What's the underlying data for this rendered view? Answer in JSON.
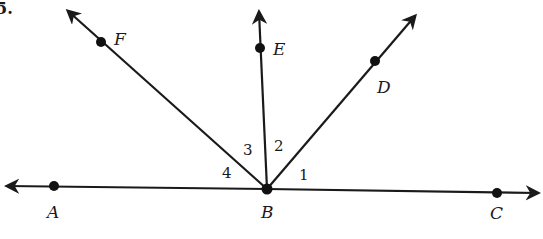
{
  "diagram": {
    "type": "angles-at-a-point",
    "corner_mark": "5.",
    "vertex": {
      "label": "B",
      "x": 267,
      "y": 189
    },
    "line": {
      "name": "line AC",
      "points": [
        {
          "label": "A",
          "x": 54,
          "y": 186
        },
        {
          "label": "C",
          "x": 497,
          "y": 193
        }
      ],
      "arrow_left": {
        "x": 7,
        "y": 186
      },
      "arrow_right": {
        "x": 538,
        "y": 193
      }
    },
    "rays": [
      {
        "name": "ray BF",
        "point": {
          "label": "F",
          "x": 101,
          "y": 42
        },
        "arrow": {
          "x": 68,
          "y": 11
        }
      },
      {
        "name": "ray BE",
        "point": {
          "label": "E",
          "x": 260,
          "y": 48
        },
        "arrow": {
          "x": 259,
          "y": 12
        }
      },
      {
        "name": "ray BD",
        "point": {
          "label": "D",
          "x": 375,
          "y": 61
        },
        "arrow": {
          "x": 415,
          "y": 16
        }
      }
    ],
    "angle_labels": [
      {
        "label": "1",
        "x": 299,
        "y": 179
      },
      {
        "label": "2",
        "x": 275,
        "y": 150
      },
      {
        "label": "3",
        "x": 244,
        "y": 154
      },
      {
        "label": "4",
        "x": 222,
        "y": 178
      }
    ],
    "point_labels": {
      "A": {
        "text": "A",
        "x": 47,
        "y": 218
      },
      "B": {
        "text": "B",
        "x": 262,
        "y": 218
      },
      "C": {
        "text": "C",
        "x": 490,
        "y": 219
      },
      "D": {
        "text": "D",
        "x": 378,
        "y": 94
      },
      "E": {
        "text": "E",
        "x": 274,
        "y": 55
      },
      "F": {
        "text": "F",
        "x": 115,
        "y": 45
      }
    },
    "colors": {
      "ink": "#1a1a1a",
      "background": "#ffffff"
    }
  }
}
